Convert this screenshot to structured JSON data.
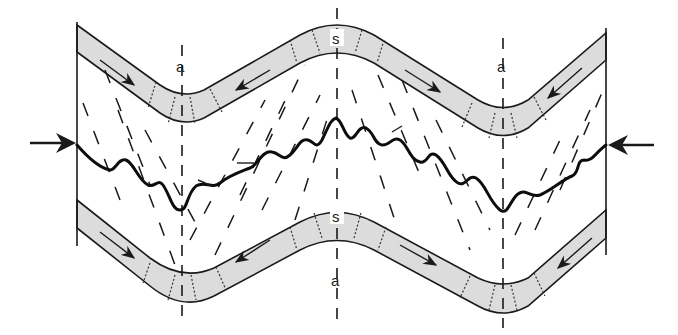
{
  "diagram": {
    "title": "",
    "labels": {
      "axial_left_top": "a",
      "axial_right_top": "a",
      "axial_center_bottom": "a",
      "hinge_top": "s",
      "hinge_bottom": "s"
    },
    "arrows": {
      "left": "compression-arrow-right",
      "right": "compression-arrow-left"
    },
    "colors": {
      "line": "#1a1a1a",
      "layer_fill": "#dcdcdc",
      "background": "#ffffff"
    },
    "elements": [
      "upper folded layer",
      "lower folded layer",
      "axial trace lines",
      "cleavage fan (dashed)",
      "stylolite seam (thick wavy line)",
      "shear-sense arrows within layers",
      "lateral compression arrows"
    ]
  }
}
